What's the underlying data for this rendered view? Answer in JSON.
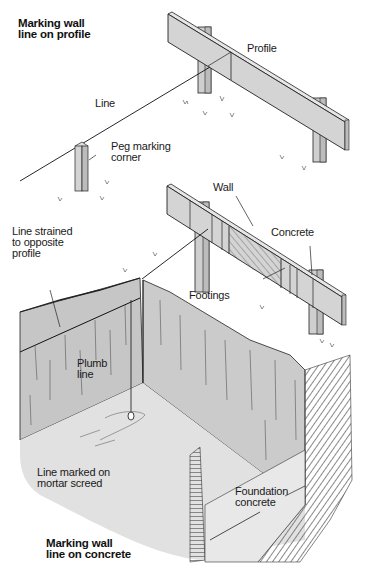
{
  "figure": {
    "type": "technical-illustration"
  },
  "titles": {
    "top": "Marking wall\nline on profile",
    "bottom": "Marking wall\nline on concrete"
  },
  "labels": {
    "profile": "Profile",
    "line": "Line",
    "peg": "Peg marking\ncorner",
    "wall": "Wall",
    "concrete": "Concrete",
    "line_strained": "Line strained\nto opposite\nprofile",
    "footings": "Footings",
    "plumb": "Plumb\nline",
    "line_marked": "Line marked on\nmortar screed",
    "foundation": "Foundation\nconcrete"
  },
  "colors": {
    "timber": "#d4d4d4",
    "timber_dark": "#bdbdbd",
    "earth_wall": "#c9c9c9",
    "earth_wall_dark": "#b8b8b8",
    "screed": "#e2e2e2",
    "hatch": "#8a8a8a",
    "ink": "#1a1a1a"
  }
}
